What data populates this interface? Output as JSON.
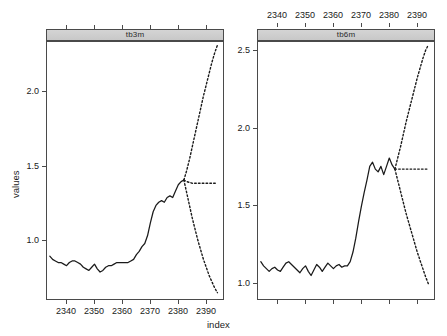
{
  "figure": {
    "xlabel": "index",
    "ylabel": "values"
  },
  "panels": [
    {
      "id": "left",
      "strip_label": "tb3m",
      "y_ticks": [
        "1.0",
        "1.5",
        "2.0"
      ],
      "x_ticks": [
        "2340",
        "2350",
        "2360",
        "2370",
        "2380",
        "2390"
      ],
      "x_ticks_top_unlabeled": 6
    },
    {
      "id": "right",
      "strip_label": "tb6m",
      "y_ticks": [
        "1.0",
        "1.5",
        "2.0",
        "2.5"
      ],
      "x_ticks": [
        "2340",
        "2350",
        "2360",
        "2370",
        "2380",
        "2390"
      ],
      "x_ticks_bottom_unlabeled": 6
    }
  ],
  "chart_data": {
    "type": "line",
    "title": "",
    "xlabel": "index",
    "ylabel": "values",
    "grid": false,
    "legend": null,
    "layout": "1 row x 2 columns, shared x axis, independent y axes",
    "panels": [
      {
        "name": "tb3m",
        "strip_label": "tb3m",
        "xlim": [
          2333,
          2396
        ],
        "ylim": [
          0.72,
          2.34
        ],
        "x_tick_values": [
          2340,
          2350,
          2360,
          2370,
          2380,
          2390
        ],
        "y_tick_values": [
          1.0,
          1.5,
          2.0
        ],
        "series": [
          {
            "name": "observed",
            "style": "solid",
            "color": "#1a1a1a",
            "x": [
              2334,
              2335,
              2336,
              2337,
              2338,
              2339,
              2340,
              2341,
              2342,
              2343,
              2344,
              2345,
              2346,
              2347,
              2348,
              2349,
              2350,
              2351,
              2352,
              2353,
              2354,
              2355,
              2356,
              2357,
              2358,
              2359,
              2360,
              2361,
              2362,
              2363,
              2364,
              2365,
              2366,
              2367,
              2368,
              2369,
              2370,
              2371,
              2372,
              2373,
              2374,
              2375,
              2376,
              2377,
              2378,
              2379,
              2380,
              2381,
              2382
            ],
            "y": [
              0.99,
              0.97,
              0.96,
              0.95,
              0.95,
              0.94,
              0.93,
              0.95,
              0.96,
              0.96,
              0.95,
              0.94,
              0.92,
              0.91,
              0.9,
              0.92,
              0.94,
              0.91,
              0.89,
              0.9,
              0.92,
              0.93,
              0.93,
              0.94,
              0.95,
              0.95,
              0.95,
              0.95,
              0.95,
              0.96,
              0.97,
              1.0,
              1.02,
              1.05,
              1.07,
              1.12,
              1.2,
              1.27,
              1.31,
              1.33,
              1.34,
              1.33,
              1.36,
              1.37,
              1.36,
              1.4,
              1.44,
              1.46,
              1.47
            ]
          },
          {
            "name": "point-forecast",
            "style": "dotted",
            "color": "#1a1a1a",
            "x": [
              2382,
              2383,
              2384,
              2385,
              2386,
              2387,
              2388,
              2389,
              2390,
              2391,
              2392,
              2393,
              2394
            ],
            "y": [
              1.47,
              1.46,
              1.455,
              1.45,
              1.45,
              1.45,
              1.45,
              1.45,
              1.45,
              1.45,
              1.45,
              1.45,
              1.45
            ]
          },
          {
            "name": "upper-interval",
            "style": "dotted",
            "color": "#1a1a1a",
            "x": [
              2382,
              2383,
              2384,
              2385,
              2386,
              2387,
              2388,
              2389,
              2390,
              2391,
              2392,
              2393,
              2394
            ],
            "y": [
              1.47,
              1.53,
              1.6,
              1.68,
              1.76,
              1.84,
              1.92,
              2.0,
              2.07,
              2.14,
              2.21,
              2.27,
              2.32
            ]
          },
          {
            "name": "lower-interval",
            "style": "dotted",
            "color": "#1a1a1a",
            "x": [
              2382,
              2383,
              2384,
              2385,
              2386,
              2387,
              2388,
              2389,
              2390,
              2391,
              2392,
              2393,
              2394
            ],
            "y": [
              1.47,
              1.39,
              1.31,
              1.23,
              1.16,
              1.09,
              1.03,
              0.97,
              0.92,
              0.87,
              0.83,
              0.79,
              0.76
            ]
          }
        ]
      },
      {
        "name": "tb6m",
        "strip_label": "tb6m",
        "xlim": [
          2333,
          2396
        ],
        "ylim": [
          0.76,
          2.62
        ],
        "x_tick_values": [
          2340,
          2350,
          2360,
          2370,
          2380,
          2390
        ],
        "y_tick_values": [
          1.0,
          1.5,
          2.0,
          2.5
        ],
        "series": [
          {
            "name": "observed",
            "style": "solid",
            "color": "#1a1a1a",
            "x": [
              2334,
              2335,
              2336,
              2337,
              2338,
              2339,
              2340,
              2341,
              2342,
              2343,
              2344,
              2345,
              2346,
              2347,
              2348,
              2349,
              2350,
              2351,
              2352,
              2353,
              2354,
              2355,
              2356,
              2357,
              2358,
              2359,
              2360,
              2361,
              2362,
              2363,
              2364,
              2365,
              2366,
              2367,
              2368,
              2369,
              2370,
              2371,
              2372,
              2373,
              2374,
              2375,
              2376,
              2377,
              2378,
              2379,
              2380,
              2381,
              2382
            ],
            "y": [
              1.03,
              1.0,
              0.98,
              0.96,
              0.98,
              0.99,
              0.97,
              0.96,
              0.99,
              1.02,
              1.03,
              1.01,
              0.99,
              0.97,
              0.95,
              0.98,
              1.0,
              0.96,
              0.93,
              0.97,
              1.01,
              0.99,
              0.96,
              0.99,
              1.02,
              1.0,
              0.98,
              1.0,
              1.01,
              0.99,
              1.0,
              1.0,
              1.03,
              1.1,
              1.2,
              1.32,
              1.43,
              1.53,
              1.62,
              1.72,
              1.75,
              1.7,
              1.68,
              1.72,
              1.66,
              1.72,
              1.78,
              1.73,
              1.7
            ]
          },
          {
            "name": "point-forecast",
            "style": "dotted",
            "color": "#1a1a1a",
            "x": [
              2382,
              2383,
              2384,
              2385,
              2386,
              2387,
              2388,
              2389,
              2390,
              2391,
              2392,
              2393,
              2394
            ],
            "y": [
              1.7,
              1.7,
              1.7,
              1.7,
              1.7,
              1.7,
              1.7,
              1.7,
              1.7,
              1.7,
              1.7,
              1.7,
              1.7
            ]
          },
          {
            "name": "upper-interval",
            "style": "dotted",
            "color": "#1a1a1a",
            "x": [
              2382,
              2383,
              2384,
              2385,
              2386,
              2387,
              2388,
              2389,
              2390,
              2391,
              2392,
              2393,
              2394
            ],
            "y": [
              1.7,
              1.78,
              1.86,
              1.95,
              2.04,
              2.12,
              2.2,
              2.28,
              2.36,
              2.43,
              2.5,
              2.56,
              2.6
            ]
          },
          {
            "name": "lower-interval",
            "style": "dotted",
            "color": "#1a1a1a",
            "x": [
              2382,
              2383,
              2384,
              2385,
              2386,
              2387,
              2388,
              2389,
              2390,
              2391,
              2392,
              2393,
              2394
            ],
            "y": [
              1.7,
              1.62,
              1.54,
              1.46,
              1.38,
              1.31,
              1.24,
              1.17,
              1.1,
              1.04,
              0.98,
              0.92,
              0.87
            ]
          }
        ]
      }
    ]
  }
}
